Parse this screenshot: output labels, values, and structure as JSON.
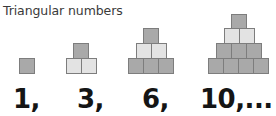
{
  "title": "Triangular numbers",
  "colors": {
    "block_dark": "#a9a9a9",
    "block_light": "#e3e3e3",
    "block_border": "#7d7d7d",
    "text": "#151515"
  },
  "figures": [
    {
      "value": 1,
      "label": "1,",
      "rows": [
        1
      ]
    },
    {
      "value": 3,
      "label": "3,",
      "rows": [
        1,
        2
      ]
    },
    {
      "value": 6,
      "label": "6,",
      "rows": [
        1,
        2,
        3
      ]
    },
    {
      "value": 10,
      "label": "10,...",
      "rows": [
        1,
        2,
        3,
        4
      ]
    }
  ]
}
